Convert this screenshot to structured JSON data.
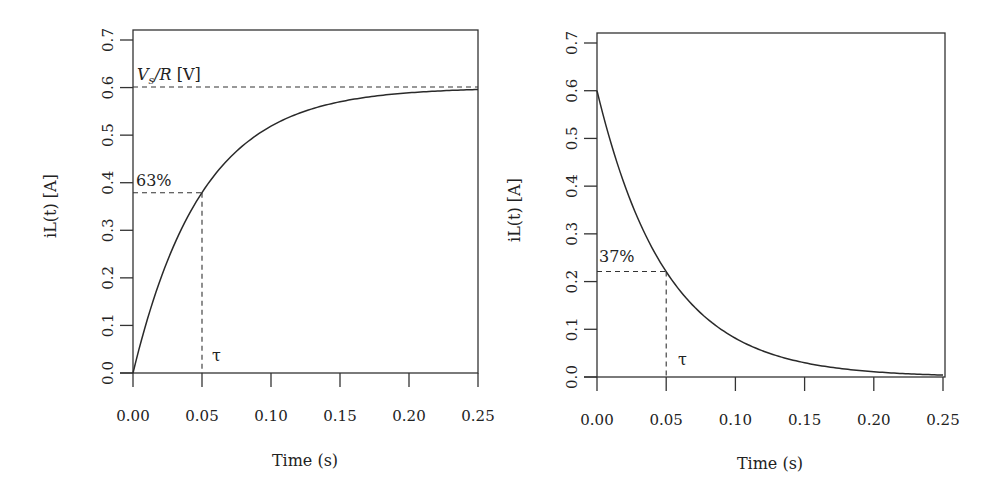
{
  "chart_data": [
    {
      "type": "line",
      "panel": "left",
      "title": "",
      "xlabel": "Time (s)",
      "ylabel": "iL(t) [A]",
      "xlim": [
        0,
        0.25
      ],
      "ylim": [
        0,
        0.7
      ],
      "x_ticks": [
        "0.00",
        "0.05",
        "0.10",
        "0.15",
        "0.20",
        "0.25"
      ],
      "y_ticks": [
        "0.0",
        "0.1",
        "0.2",
        "0.3",
        "0.4",
        "0.5",
        "0.6",
        "0.7"
      ],
      "grid": false,
      "legend": null,
      "series": [
        {
          "name": "iL(t) charging",
          "formula": "0.6*(1-exp(-t/0.05))",
          "x": [
            0.0,
            0.01,
            0.02,
            0.03,
            0.04,
            0.05,
            0.06,
            0.08,
            0.1,
            0.125,
            0.15,
            0.175,
            0.2,
            0.225,
            0.25
          ],
          "values": [
            0.0,
            0.109,
            0.198,
            0.271,
            0.33,
            0.379,
            0.419,
            0.479,
            0.519,
            0.551,
            0.57,
            0.582,
            0.589,
            0.593,
            0.596
          ]
        }
      ],
      "annotations": [
        {
          "text": "V_s/R [V]",
          "type": "hline",
          "y": 0.6
        },
        {
          "text": "63%",
          "type": "guide",
          "x": 0.05,
          "y": 0.379
        },
        {
          "text": "τ",
          "type": "label",
          "x": 0.05
        }
      ]
    },
    {
      "type": "line",
      "panel": "right",
      "title": "",
      "xlabel": "Time (s)",
      "ylabel": "iL(t) [A]",
      "xlim": [
        0,
        0.25
      ],
      "ylim": [
        0,
        0.7
      ],
      "x_ticks": [
        "0.00",
        "0.05",
        "0.10",
        "0.15",
        "0.20",
        "0.25"
      ],
      "y_ticks": [
        "0.0",
        "0.1",
        "0.2",
        "0.3",
        "0.4",
        "0.5",
        "0.6",
        "0.7"
      ],
      "grid": false,
      "legend": null,
      "series": [
        {
          "name": "iL(t) discharging",
          "formula": "0.6*exp(-t/0.05)",
          "x": [
            0.0,
            0.01,
            0.02,
            0.03,
            0.04,
            0.05,
            0.06,
            0.08,
            0.1,
            0.125,
            0.15,
            0.175,
            0.2,
            0.225,
            0.25
          ],
          "values": [
            0.6,
            0.491,
            0.402,
            0.329,
            0.27,
            0.221,
            0.181,
            0.121,
            0.081,
            0.049,
            0.03,
            0.018,
            0.011,
            0.007,
            0.004
          ]
        }
      ],
      "annotations": [
        {
          "text": "37%",
          "type": "guide",
          "x": 0.05,
          "y": 0.221
        },
        {
          "text": "τ",
          "type": "label",
          "x": 0.05
        }
      ]
    }
  ],
  "left": {
    "ylabel": "iL(t) [A]",
    "xlabel": "Time (s)",
    "annot_vs": "V",
    "annot_vs_sub": "s",
    "annot_vs_rest": "/R",
    "annot_vs_unit": " [V]",
    "annot_pct": "63%",
    "annot_tau": "τ"
  },
  "right": {
    "ylabel": "iL(t) [A]",
    "xlabel": "Time (s)",
    "annot_pct": "37%",
    "annot_tau": "τ"
  }
}
